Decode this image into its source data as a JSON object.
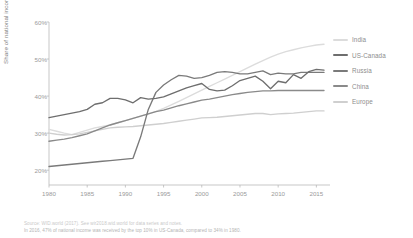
{
  "chart_data": {
    "type": "line",
    "title": "",
    "xlabel": "",
    "ylabel": "Share of national income (%)",
    "xlim": [
      1980,
      2016
    ],
    "ylim": [
      16,
      60
    ],
    "ytick_labels": [
      "20%",
      "30%",
      "40%",
      "50%",
      "60%"
    ],
    "ytick_values": [
      20,
      30,
      40,
      50,
      60
    ],
    "xtick_labels": [
      "1980",
      "1985",
      "1990",
      "1995",
      "2000",
      "2005",
      "2010",
      "2015"
    ],
    "xtick_values": [
      1980,
      1985,
      1990,
      1995,
      2000,
      2005,
      2010,
      2015
    ],
    "grid": false,
    "legend_position": "right",
    "x": [
      1980,
      1981,
      1982,
      1983,
      1984,
      1985,
      1986,
      1987,
      1988,
      1989,
      1990,
      1991,
      1992,
      1993,
      1994,
      1995,
      1996,
      1997,
      1998,
      1999,
      2000,
      2001,
      2002,
      2003,
      2004,
      2005,
      2006,
      2007,
      2008,
      2009,
      2010,
      2011,
      2012,
      2013,
      2014,
      2015,
      2016
    ],
    "series": [
      {
        "name": "India",
        "color": "#dcdcdc",
        "values": [
          31.0,
          30.5,
          30.0,
          29.6,
          30.2,
          30.8,
          31.4,
          31.8,
          32.2,
          32.8,
          33.4,
          34.0,
          34.6,
          35.2,
          35.9,
          36.7,
          37.6,
          38.6,
          39.6,
          40.6,
          41.6,
          42.6,
          43.6,
          44.6,
          45.6,
          46.6,
          47.6,
          48.6,
          49.6,
          50.5,
          51.3,
          52.0,
          52.5,
          53.0,
          53.4,
          53.8,
          54.0
        ]
      },
      {
        "name": "US-Canada",
        "color": "#6e6e6e",
        "values": [
          34.2,
          34.6,
          35.0,
          35.4,
          35.8,
          36.4,
          37.8,
          38.2,
          39.4,
          39.4,
          39.0,
          38.2,
          39.6,
          39.2,
          39.4,
          39.8,
          40.6,
          41.4,
          42.2,
          42.8,
          43.4,
          41.8,
          41.4,
          41.6,
          42.8,
          44.2,
          44.8,
          45.4,
          44.0,
          42.0,
          44.0,
          43.6,
          45.8,
          44.8,
          46.6,
          47.2,
          47.0
        ]
      },
      {
        "name": "Russia",
        "color": "#7a7a7a",
        "values": [
          21.0,
          21.2,
          21.4,
          21.6,
          21.8,
          22.0,
          22.2,
          22.4,
          22.6,
          22.8,
          23.0,
          23.2,
          29.0,
          36.4,
          41.0,
          43.0,
          44.4,
          45.6,
          45.4,
          44.8,
          45.0,
          45.6,
          46.4,
          46.6,
          46.4,
          46.0,
          46.0,
          46.4,
          46.8,
          45.8,
          46.2,
          46.0,
          46.0,
          46.4,
          46.4,
          46.4,
          46.4
        ]
      },
      {
        "name": "China",
        "color": "#8a8a8a",
        "values": [
          27.8,
          28.1,
          28.4,
          28.8,
          29.3,
          29.8,
          30.6,
          31.4,
          32.2,
          32.8,
          33.4,
          34.0,
          34.6,
          35.2,
          35.8,
          36.2,
          36.8,
          37.4,
          37.9,
          38.4,
          38.9,
          39.2,
          39.6,
          40.0,
          40.4,
          40.7,
          41.0,
          41.2,
          41.4,
          41.4,
          41.5,
          41.5,
          41.5,
          41.5,
          41.5,
          41.5,
          41.5
        ]
      },
      {
        "name": "Europe",
        "color": "#cfcfcf",
        "values": [
          30.0,
          29.7,
          29.5,
          29.6,
          29.8,
          30.2,
          30.6,
          31.0,
          31.4,
          31.6,
          31.7,
          31.8,
          32.0,
          32.2,
          32.4,
          32.6,
          32.9,
          33.2,
          33.5,
          33.8,
          34.1,
          34.2,
          34.3,
          34.5,
          34.7,
          34.9,
          35.1,
          35.3,
          35.3,
          35.0,
          35.2,
          35.3,
          35.4,
          35.6,
          35.8,
          36.0,
          36.0
        ]
      }
    ]
  },
  "notes": [
    "Source: WID.world (2017). See wir2018.wid.world for data series and notes.",
    "In 2016, 47% of national income was received by the top 10% in US-Canada, compared to 34% in 1980."
  ],
  "axis_color": "#b9b9b9"
}
